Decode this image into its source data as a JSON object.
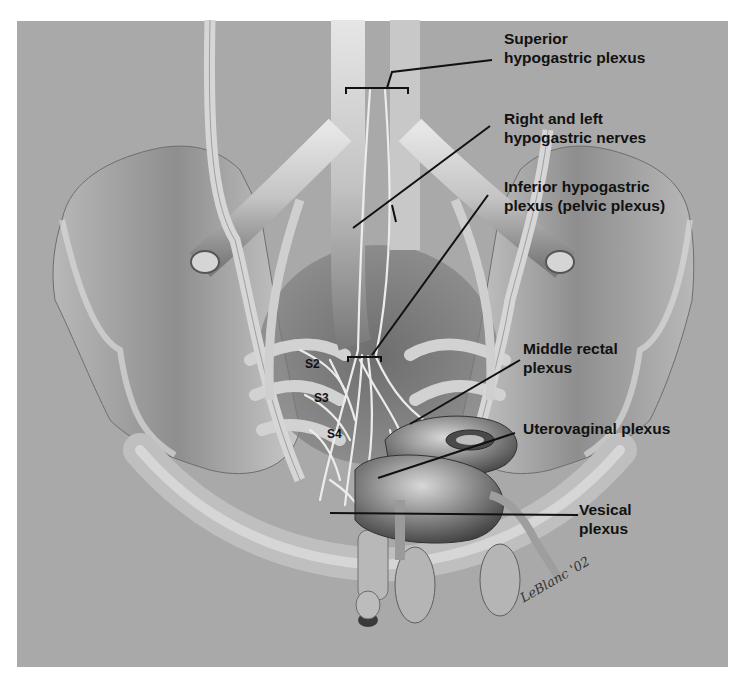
{
  "figure": {
    "background_color": "#a9a9a9",
    "line_color": "#111111"
  },
  "labels": [
    {
      "id": "superior",
      "lines": [
        "Superior",
        "hypogastric plexus"
      ]
    },
    {
      "id": "hypogastric-nerves",
      "lines": [
        "Right and left",
        "hypogastric nerves"
      ]
    },
    {
      "id": "inferior",
      "lines": [
        "Inferior hypogastric",
        "plexus (pelvic plexus)"
      ]
    },
    {
      "id": "middle-rectal",
      "lines": [
        "Middle rectal",
        "plexus"
      ]
    },
    {
      "id": "uterovaginal",
      "lines": [
        "Uterovaginal plexus"
      ]
    },
    {
      "id": "vesical",
      "lines": [
        "Vesical",
        "plexus"
      ]
    }
  ],
  "sacral_nerves": [
    "S2",
    "S3",
    "S4"
  ],
  "signature": "LeBlanc '02"
}
